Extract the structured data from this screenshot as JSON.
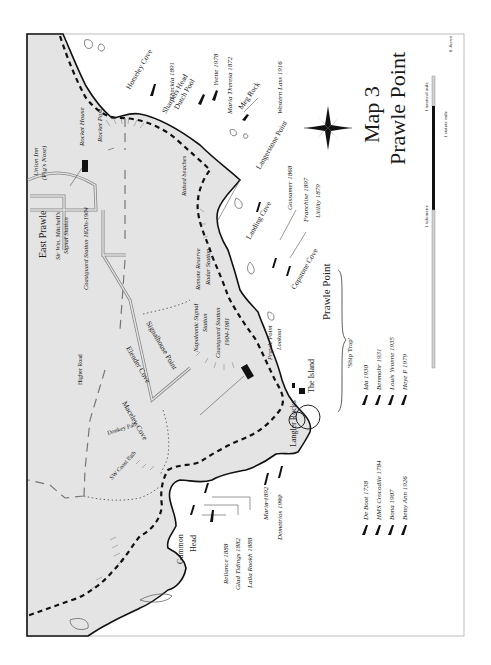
{
  "map": {
    "title_line1": "Map 3",
    "title_line2": "Prawle Point",
    "credit": "R. Barrett",
    "scale": {
      "nautical": "1 nautical mile",
      "statute": "1 statute mile",
      "kilometre": "1 kilometre"
    },
    "compass": "compass-rose",
    "places": {
      "east_prawle": "East Prawle",
      "union_inn": "Union Inn",
      "pigs_nose": "(Pig's Nose)",
      "rocket_house": "Rocket House",
      "rocket_post": "Rocket Post",
      "signal_station_1": "Sir Wm. Mitchell's",
      "signal_station_2": "Signal Station",
      "coastguard_1820": "Coastguard Station 1820s-1904",
      "raised_beaches": "Raised beaches",
      "remote_radar_1": "Remote Reserve",
      "remote_radar_2": "Radar Station",
      "napoleonic_1": "Napoleonic Signal",
      "napoleonic_2": "Station",
      "coastguard_1904_1": "Coastguard Station",
      "coastguard_1904_2": "1904-1981",
      "lookout_1": "Prawle Point",
      "lookout_2": "Lookout",
      "higher_road": "Higher Road",
      "donkey_path": "Donkey Path",
      "sw_coast_path": "SW Coast Path",
      "horseley_cove": "Horseley Cove",
      "sharpers_head": "Sharpers Head",
      "dutch_pool": "Dutch Pool",
      "meg_rock": "Meg Rock",
      "langerstone_point": "Langerstone Point",
      "landing_cove": "Landing Cove",
      "copstone_cove": "Copstone Cove",
      "prawle_point": "Prawle Point",
      "the_island": "The Island",
      "langler_rocks": "Langler Rocks",
      "signalhouse_point": "Signalhouse Point",
      "elender_cove": "Elender Cove",
      "maceley_cove": "Maceley Cove",
      "gammon_head_1": "Gammon",
      "gammon_head_2": "Head"
    },
    "wrecks": [
      "Theckla 1891",
      "Yvette 1978",
      "Maria Theresa 1872",
      "Western Lass 1916",
      "Gossamer 1868",
      "Franchise 1897",
      "Utility 1879",
      "Reliance 1888",
      "Glad Tidings 1882",
      "Lalla Rookh 1888",
      "Maria 1892",
      "Demetrios 1992"
    ],
    "ship_trap": {
      "heading": "'Ship Trap'",
      "left": [
        "De Boot 1738",
        "HMS Crocodile 1784",
        "Bona 1907",
        "Betsy Ann 1926"
      ],
      "right": [
        "Ida 1930",
        "Benmohr 1931",
        "Louis Yvonne 1935",
        "Heye P 1979"
      ]
    }
  }
}
